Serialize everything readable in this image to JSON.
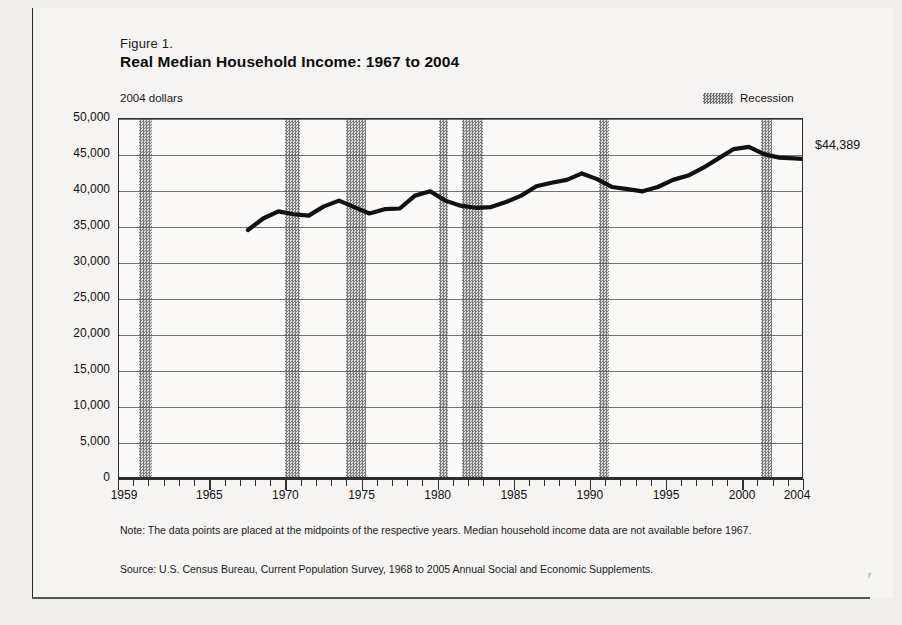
{
  "figure": {
    "label": "Figure 1.",
    "title": "Real Median Household Income:  1967 to 2004",
    "y_units": "2004 dollars",
    "end_value_callout": "$44,389",
    "note": "Note:  The data points are placed at the midpoints of the respective years.   Median household income data are not available before 1967.",
    "source": "Source:  U.S. Census Bureau, Current Population Survey, 1968 to 2005 Annual Social and Economic Supplements.",
    "speck": "r"
  },
  "legend": {
    "items": [
      {
        "label": "Recession",
        "swatch": "grey-hatch",
        "color": "#7a7a7a"
      }
    ]
  },
  "chart_data": {
    "type": "line",
    "title": "Real Median Household Income:  1967 to 2004",
    "subtitle": "Figure 1.",
    "xlabel": "",
    "ylabel": "2004 dollars",
    "xlim": [
      1959,
      2004
    ],
    "ylim": [
      0,
      50000
    ],
    "grid": true,
    "legend_position": "top-right",
    "y_ticks": [
      0,
      5000,
      10000,
      15000,
      20000,
      25000,
      30000,
      35000,
      40000,
      45000,
      50000
    ],
    "y_tick_labels": [
      "0",
      "5,000",
      "10,000",
      "15,000",
      "20,000",
      "25,000",
      "30,000",
      "35,000",
      "40,000",
      "45,000",
      "50,000"
    ],
    "x_ticks": [
      1959,
      1965,
      1970,
      1975,
      1980,
      1985,
      1990,
      1995,
      2000,
      2004
    ],
    "x_tick_labels": [
      "1959",
      "1965",
      "1970",
      "1975",
      "1980",
      "1985",
      "1990",
      "1995",
      "2000",
      "2004"
    ],
    "x_minor_tick_step": 1,
    "series": [
      {
        "name": "Real median household income",
        "color": "#111111",
        "x": [
          1967,
          1968,
          1969,
          1970,
          1971,
          1972,
          1973,
          1974,
          1975,
          1976,
          1977,
          1978,
          1979,
          1980,
          1981,
          1982,
          1983,
          1984,
          1985,
          1986,
          1987,
          1988,
          1989,
          1990,
          1991,
          1992,
          1993,
          1994,
          1995,
          1996,
          1997,
          1998,
          1999,
          2000,
          2001,
          2002,
          2003,
          2004
        ],
        "values": [
          34500,
          36100,
          37100,
          36700,
          36500,
          37800,
          38600,
          37700,
          36800,
          37400,
          37500,
          39300,
          39900,
          38600,
          37900,
          37600,
          37700,
          38400,
          39300,
          40600,
          41100,
          41500,
          42400,
          41600,
          40500,
          40200,
          39900,
          40500,
          41500,
          42100,
          43200,
          44500,
          45800,
          46100,
          45100,
          44600,
          44500,
          44389
        ]
      }
    ],
    "annotations": [
      {
        "text": "$44,389",
        "x": 2004,
        "y": 44389,
        "position": "right-of-line-end"
      }
    ],
    "recession_bands": [
      {
        "start": 1960.3,
        "end": 1961.2
      },
      {
        "start": 1969.9,
        "end": 1970.9
      },
      {
        "start": 1973.9,
        "end": 1975.2
      },
      {
        "start": 1980.0,
        "end": 1980.6
      },
      {
        "start": 1981.5,
        "end": 1982.9
      },
      {
        "start": 1990.5,
        "end": 1991.2
      },
      {
        "start": 2001.2,
        "end": 2001.9
      }
    ]
  }
}
